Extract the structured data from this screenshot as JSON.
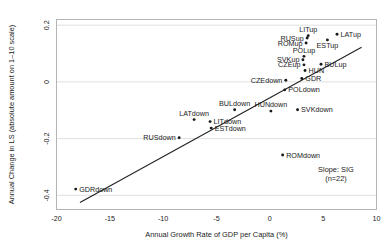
{
  "chart_data": {
    "type": "scatter",
    "title": "",
    "xlabel": "Annual Growth Rate of GDP per Capita (%)",
    "ylabel": "Annual Change in LS (absolute amount on 1–10 scale)",
    "xlim": [
      -20,
      10
    ],
    "ylim": [
      -0.45,
      0.22
    ],
    "xticks": [
      -20,
      -15,
      -10,
      -5,
      0,
      5,
      10
    ],
    "xticklabels": [
      "-20",
      "-15",
      "-10",
      "-5",
      "0",
      "5",
      "10"
    ],
    "yticks": [
      0.2,
      0,
      -0.2,
      -0.4
    ],
    "yticklabels": [
      "0.2",
      "0",
      "-0.2",
      "-0.4"
    ],
    "grid": "horizontal",
    "legend": "none",
    "points": [
      {
        "label": "LATup",
        "x": 6.3,
        "y": 0.168,
        "label_pos": "right"
      },
      {
        "label": "LITup",
        "x": 3.6,
        "y": 0.163,
        "label_pos": "above"
      },
      {
        "label": "RUSup",
        "x": 3.5,
        "y": 0.155,
        "label_pos": "left"
      },
      {
        "label": "ESTup",
        "x": 5.4,
        "y": 0.148,
        "label_pos": "below"
      },
      {
        "label": "ROMup",
        "x": 3.4,
        "y": 0.137,
        "label_pos": "left"
      },
      {
        "label": "POLup",
        "x": 3.2,
        "y": 0.09,
        "label_pos": "above"
      },
      {
        "label": "SVKup",
        "x": 3.1,
        "y": 0.078,
        "label_pos": "left"
      },
      {
        "label": "CZEup",
        "x": 3.2,
        "y": 0.06,
        "label_pos": "left"
      },
      {
        "label": "BULup",
        "x": 4.8,
        "y": 0.062,
        "label_pos": "right"
      },
      {
        "label": "HUN",
        "x": 3.3,
        "y": 0.04,
        "label_pos": "right"
      },
      {
        "label": "GDR",
        "x": 3.0,
        "y": 0.012,
        "label_pos": "right"
      },
      {
        "label": "CZEdown",
        "x": 1.5,
        "y": 0.006,
        "label_pos": "left"
      },
      {
        "label": "POLdown",
        "x": 1.4,
        "y": -0.028,
        "label_pos": "right"
      },
      {
        "label": "SVKdown",
        "x": 2.6,
        "y": -0.098,
        "label_pos": "right"
      },
      {
        "label": "HUNdown",
        "x": 0.1,
        "y": -0.103,
        "label_pos": "above"
      },
      {
        "label": "BULdown",
        "x": -3.3,
        "y": -0.098,
        "label_pos": "above"
      },
      {
        "label": "LATdown",
        "x": -7.1,
        "y": -0.133,
        "label_pos": "above"
      },
      {
        "label": "LITdown",
        "x": -5.6,
        "y": -0.14,
        "label_pos": "right"
      },
      {
        "label": "ESTdown",
        "x": -5.5,
        "y": -0.163,
        "label_pos": "right"
      },
      {
        "label": "RUSdown",
        "x": -8.5,
        "y": -0.197,
        "label_pos": "left"
      },
      {
        "label": "ROMdown",
        "x": 1.2,
        "y": -0.258,
        "label_pos": "right"
      },
      {
        "label": "GDRdown",
        "x": -18.2,
        "y": -0.378,
        "label_pos": "right"
      }
    ],
    "trendline": {
      "x_start": -17.8,
      "y_start": -0.425,
      "x_end": 8.6,
      "y_end": 0.122
    },
    "annotations": [
      {
        "text": "Slope: SIG",
        "x": 6.2,
        "y": -0.318
      },
      {
        "text": "(n=22)",
        "x": 6.2,
        "y": -0.348
      }
    ]
  }
}
